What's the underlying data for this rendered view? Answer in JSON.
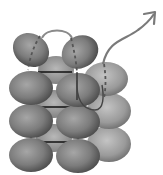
{
  "figure": {
    "colors": {
      "background": "#ffffff",
      "sphere_dark": "#555555",
      "sphere_mid": "#8a8a8a",
      "sphere_light": "#b5b5b5",
      "path": "#6e6e6e",
      "link_line": "#111111"
    },
    "rows": 4,
    "columns": 3,
    "arrow": {
      "direction": "up-right"
    }
  }
}
